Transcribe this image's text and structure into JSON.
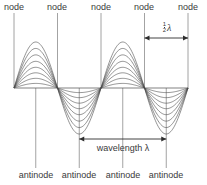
{
  "figure": {
    "type": "standing-wave-diagram",
    "title": "",
    "background_color": "#ffffff",
    "line_color": "#4a4a4a",
    "guide_color": "#8c8c8c",
    "text_color": "#3a3a3a"
  },
  "labels": {
    "node": "node",
    "antinode": "antinode",
    "wavelength": "wavelength λ",
    "half_wavelength_numerator": "1",
    "half_wavelength_denominator": "2",
    "half_wavelength_symbol": "λ"
  },
  "nodes": [
    {
      "label": "node",
      "x": 14
    },
    {
      "label": "node",
      "x": 57.5
    },
    {
      "label": "node",
      "x": 101
    },
    {
      "label": "node",
      "x": 144.5
    },
    {
      "label": "node",
      "x": 188
    }
  ],
  "antinodes": [
    {
      "label": "antinode",
      "x": 35.75
    },
    {
      "label": "antinode",
      "x": 79.25
    },
    {
      "label": "antinode",
      "x": 122.75
    },
    {
      "label": "antinode",
      "x": 166.25
    }
  ],
  "annotations": [
    {
      "name": "half-wavelength",
      "text": "1/2 λ",
      "x_start": 144.5,
      "x_end": 188,
      "y": 38,
      "arrow": "double"
    },
    {
      "name": "wavelength",
      "text": "wavelength λ",
      "x_start": 79.25,
      "x_end": 166.25,
      "y": 139,
      "arrow": "double"
    }
  ],
  "chart_data": {
    "type": "line",
    "xlabel": "",
    "ylabel": "",
    "baseline_y": 88,
    "node_x": [
      14,
      57.5,
      101,
      144.5,
      188
    ],
    "antinode_x": [
      35.75,
      79.25,
      122.75,
      166.25
    ],
    "half_wavelength_px": 43.5,
    "wavelength_px": 87,
    "amplitude_scale": [
      1.0,
      0.86,
      0.72,
      0.58,
      0.45,
      0.33,
      0.21,
      0.1
    ],
    "max_amplitude_up_px": 46,
    "max_amplitude_down_px": 46,
    "lobe_count": 4,
    "lobe_directions": [
      "up",
      "down",
      "up",
      "down"
    ],
    "curve_count_per_lobe": 8,
    "grid": false,
    "legend": "none"
  }
}
